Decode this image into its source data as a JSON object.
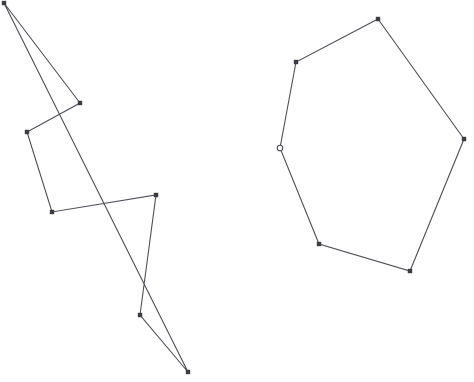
{
  "canvas": {
    "width": 474,
    "height": 382,
    "background_color": "#ffffff"
  },
  "style": {
    "line_color": "#4e4e56",
    "line_width": 1.1,
    "vertex_fill_color": "#3c3c44",
    "vertex_open_stroke_color": "#4e4e56",
    "vertex_square_size": 4.4,
    "vertex_open_radius": 2.8
  },
  "shapes": [
    {
      "id": "left-polygon",
      "name": "self-intersecting-polygon",
      "closed": true,
      "vertices": [
        {
          "label": "L1",
          "x": 4,
          "y": 3,
          "marker": "square"
        },
        {
          "label": "L2",
          "x": 80,
          "y": 103,
          "marker": "square"
        },
        {
          "label": "L3",
          "x": 27,
          "y": 132,
          "marker": "square"
        },
        {
          "label": "L4",
          "x": 52,
          "y": 212,
          "marker": "square"
        },
        {
          "label": "L5",
          "x": 156,
          "y": 195,
          "marker": "square"
        },
        {
          "label": "L6",
          "x": 140,
          "y": 315,
          "marker": "square"
        },
        {
          "label": "L7",
          "x": 188,
          "y": 372,
          "marker": "square"
        }
      ]
    },
    {
      "id": "right-polygon",
      "name": "convex-hexagon",
      "closed": true,
      "vertices": [
        {
          "label": "R1",
          "x": 378,
          "y": 19,
          "marker": "square"
        },
        {
          "label": "R2",
          "x": 464,
          "y": 139,
          "marker": "square"
        },
        {
          "label": "R3",
          "x": 410,
          "y": 271,
          "marker": "square"
        },
        {
          "label": "R4",
          "x": 319,
          "y": 244,
          "marker": "square"
        },
        {
          "label": "R5",
          "x": 280,
          "y": 148,
          "marker": "circle-open"
        },
        {
          "label": "R6",
          "x": 296,
          "y": 62,
          "marker": "square"
        }
      ]
    }
  ]
}
